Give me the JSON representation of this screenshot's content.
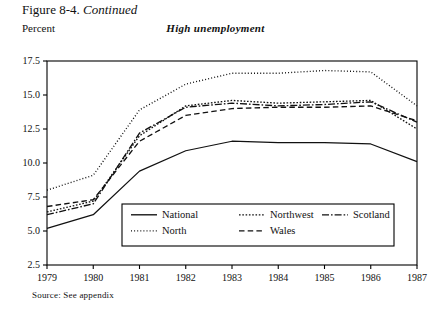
{
  "figure": {
    "caption_prefix": "Figure 8-4.",
    "caption_italic": "Continued",
    "axis_unit_label": "Percent",
    "panel_title": "High unemployment",
    "source_note": "Source: See appendix"
  },
  "colors": {
    "ink": "#111111",
    "background": "#ffffff",
    "axis": "#000000"
  },
  "chart_data": {
    "type": "line",
    "title": "High unemployment",
    "xlabel": "",
    "ylabel": "Percent",
    "x": [
      1979,
      1980,
      1981,
      1982,
      1983,
      1984,
      1985,
      1986,
      1987
    ],
    "xtick_labels": [
      "1979",
      "1980",
      "1981",
      "1982",
      "1983",
      "1984",
      "1985",
      "1986",
      "1987"
    ],
    "ytick_labels": [
      "2.5",
      "5.0",
      "7.5",
      "10.0",
      "12.5",
      "15.0",
      "17.5"
    ],
    "yticks": [
      2.5,
      5.0,
      7.5,
      10.0,
      12.5,
      15.0,
      17.5
    ],
    "xlim": [
      1979,
      1987
    ],
    "ylim": [
      2.5,
      17.5
    ],
    "grid": false,
    "legend_position": "inside-bottom-center",
    "series": [
      {
        "name": "National",
        "style": "solid",
        "values": [
          5.2,
          6.2,
          9.4,
          10.9,
          11.6,
          11.5,
          11.5,
          11.4,
          10.1
        ]
      },
      {
        "name": "North",
        "style": "dotted",
        "values": [
          8.0,
          9.1,
          13.9,
          15.8,
          16.6,
          16.6,
          16.8,
          16.7,
          14.2
        ]
      },
      {
        "name": "Northwest",
        "style": "dash-dot-short",
        "values": [
          6.4,
          7.2,
          12.0,
          14.2,
          14.6,
          14.4,
          14.5,
          14.6,
          12.5
        ]
      },
      {
        "name": "Wales",
        "style": "dashed",
        "values": [
          6.8,
          7.3,
          11.6,
          13.5,
          14.0,
          14.1,
          14.1,
          14.2,
          13.1
        ]
      },
      {
        "name": "Scotland",
        "style": "dash-dot-long",
        "values": [
          6.2,
          7.0,
          12.2,
          14.1,
          14.4,
          14.2,
          14.3,
          14.5,
          13.0
        ]
      }
    ],
    "legend_entries": [
      {
        "label": "National",
        "style": "solid"
      },
      {
        "label": "Northwest",
        "style": "dash-dot-short"
      },
      {
        "label": "Scotland",
        "style": "dash-dot-long"
      },
      {
        "label": "North",
        "style": "dotted"
      },
      {
        "label": "Wales",
        "style": "dashed"
      }
    ]
  }
}
